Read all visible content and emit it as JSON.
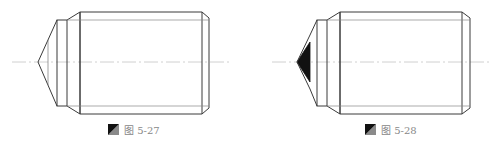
{
  "figures": [
    {
      "id": "fig-5-27",
      "caption": "图 5-27",
      "tip_style": "open"
    },
    {
      "id": "fig-5-28",
      "caption": "图 5-28",
      "tip_style": "filled"
    }
  ],
  "colors": {
    "outline": "#3a3a3a",
    "thin": "#777777",
    "centerline": "#bbbbbb",
    "fill": "#111111"
  }
}
